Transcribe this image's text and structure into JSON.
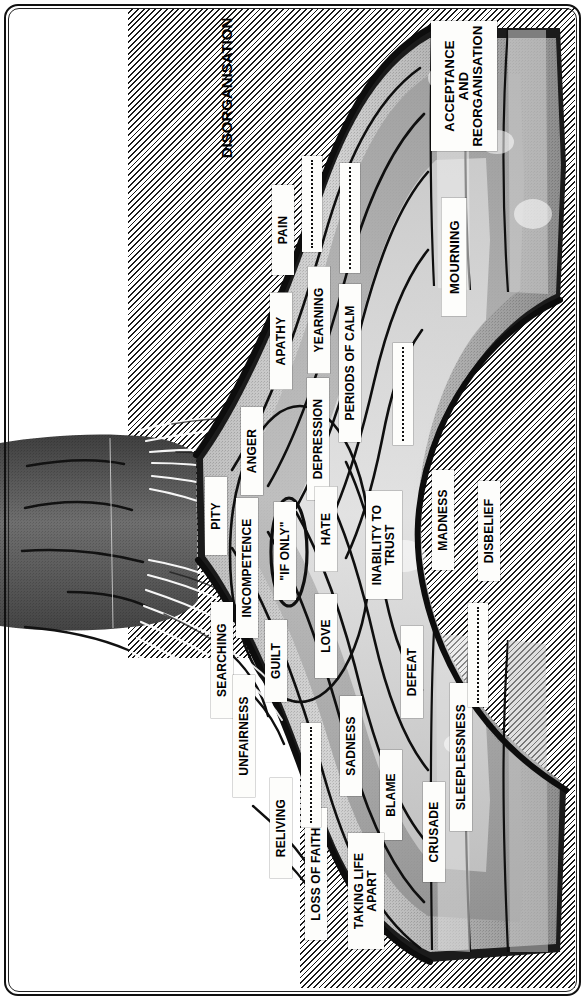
{
  "diagram": {
    "title_label": "DISORGANISATION",
    "type": "grief-process-rope-diagram",
    "stage_labels": [
      {
        "id": "disorganisation",
        "text": "DISORGANISATION",
        "style": "plain",
        "x": 226,
        "y": 88,
        "w": 200,
        "fs": 15
      },
      {
        "id": "acceptance-and-reorganisation",
        "text": "ACCEPTANCE\nAND\nREORGANISATION",
        "style": "plate",
        "x": 464,
        "y": 86,
        "w": 130,
        "h": 66,
        "fs": 13
      },
      {
        "id": "mourning",
        "text": "MOURNING",
        "style": "plate",
        "x": 454,
        "y": 257,
        "w": 118,
        "h": 25,
        "fs": 13
      }
    ],
    "strand_labels": [
      {
        "id": "pain",
        "text": "PAIN",
        "x": 283,
        "y": 230,
        "w": 90,
        "h": 22,
        "fs": 12
      },
      {
        "id": "apathy",
        "text": "APATHY",
        "x": 281,
        "y": 341,
        "w": 97,
        "h": 22,
        "fs": 12
      },
      {
        "id": "yearning",
        "text": "YEARNING",
        "x": 319,
        "y": 320,
        "w": 107,
        "h": 22,
        "fs": 12
      },
      {
        "id": "depression",
        "text": "DEPRESSION",
        "x": 318,
        "y": 439,
        "w": 122,
        "h": 22,
        "fs": 12
      },
      {
        "id": "periods-of-calm",
        "text": "PERIODS OF CALM",
        "x": 350,
        "y": 363,
        "w": 158,
        "h": 22,
        "fs": 12
      },
      {
        "id": "anger",
        "text": "ANGER",
        "x": 252,
        "y": 451,
        "w": 88,
        "h": 22,
        "fs": 12
      },
      {
        "id": "pity",
        "text": "PITY",
        "x": 216,
        "y": 516,
        "w": 78,
        "h": 22,
        "fs": 12
      },
      {
        "id": "incompetence",
        "text": "INCOMPETENCE",
        "x": 247,
        "y": 568,
        "w": 140,
        "h": 22,
        "fs": 12
      },
      {
        "id": "if-only",
        "text": "\"IF ONLY\"",
        "x": 285,
        "y": 551,
        "w": 98,
        "h": 22,
        "fs": 12
      },
      {
        "id": "hate",
        "text": "HATE",
        "x": 326,
        "y": 529,
        "w": 85,
        "h": 22,
        "fs": 12
      },
      {
        "id": "inability-to-trust",
        "text": "INABILITY TO\nTRUST",
        "x": 384,
        "y": 545,
        "w": 108,
        "h": 36,
        "fs": 12
      },
      {
        "id": "madness",
        "text": "MADNESS",
        "x": 443,
        "y": 520,
        "w": 100,
        "h": 22,
        "fs": 12
      },
      {
        "id": "disbelief",
        "text": "DISBELIEF",
        "x": 489,
        "y": 531,
        "w": 100,
        "h": 22,
        "fs": 12
      },
      {
        "id": "searching",
        "text": "SEARCHING",
        "x": 222,
        "y": 660,
        "w": 116,
        "h": 22,
        "fs": 12
      },
      {
        "id": "guilt",
        "text": "GUILT",
        "x": 276,
        "y": 661,
        "w": 82,
        "h": 22,
        "fs": 12
      },
      {
        "id": "love",
        "text": "LOVE",
        "x": 326,
        "y": 636,
        "w": 84,
        "h": 22,
        "fs": 12
      },
      {
        "id": "unfairness",
        "text": "UNFAIRNESS",
        "x": 244,
        "y": 736,
        "w": 122,
        "h": 22,
        "fs": 12
      },
      {
        "id": "sadness",
        "text": "SADNESS",
        "x": 351,
        "y": 746,
        "w": 100,
        "h": 22,
        "fs": 12
      },
      {
        "id": "defeat",
        "text": "DEFEAT",
        "x": 412,
        "y": 672,
        "w": 92,
        "h": 22,
        "fs": 12
      },
      {
        "id": "blame",
        "text": "BLAME",
        "x": 391,
        "y": 795,
        "w": 90,
        "h": 22,
        "fs": 12
      },
      {
        "id": "sleeplessness",
        "text": "SLEEPLESSNESS",
        "x": 461,
        "y": 757,
        "w": 148,
        "h": 22,
        "fs": 12
      },
      {
        "id": "crusade",
        "text": "CRUSADE",
        "x": 434,
        "y": 832,
        "w": 100,
        "h": 22,
        "fs": 12
      },
      {
        "id": "reliving",
        "text": "RELIVING",
        "x": 281,
        "y": 828,
        "w": 100,
        "h": 22,
        "fs": 12
      },
      {
        "id": "loss-of-faith",
        "text": "LOSS OF FAITH",
        "x": 316,
        "y": 874,
        "w": 132,
        "h": 22,
        "fs": 12
      },
      {
        "id": "taking-life-apart",
        "text": "TAKING LIFE\nAPART",
        "x": 366,
        "y": 891,
        "w": 116,
        "h": 36,
        "fs": 12
      }
    ],
    "blank_labels": [
      {
        "id": "blank-1",
        "x": 312,
        "y": 204,
        "w": 96,
        "h": 20
      },
      {
        "id": "blank-2",
        "x": 350,
        "y": 218,
        "w": 110,
        "h": 20
      },
      {
        "id": "blank-3",
        "x": 403,
        "y": 394,
        "w": 102,
        "h": 20
      },
      {
        "id": "blank-4",
        "x": 478,
        "y": 655,
        "w": 104,
        "h": 20
      },
      {
        "id": "blank-5",
        "x": 311,
        "y": 775,
        "w": 104,
        "h": 20
      }
    ],
    "palette": {
      "ink": "#111111",
      "paper": "#ffffff",
      "plate": "#fdfdfb",
      "rope_dark": "#4d4d4d",
      "rope_mid": "#8a8a8a",
      "rope_light": "#b9b9b9",
      "rope_pale": "#d8d8d8",
      "rope_highlight": "#efefef"
    }
  }
}
